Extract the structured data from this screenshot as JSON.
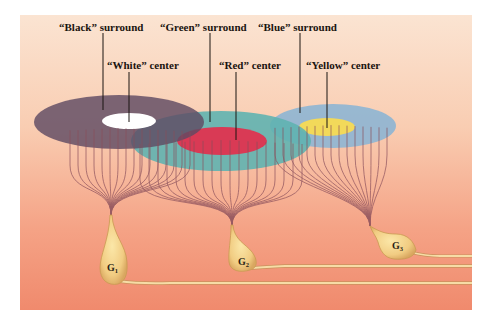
{
  "figure": {
    "panel": {
      "x": 20,
      "y": 15,
      "width": 452,
      "height": 295
    },
    "background_gradient": [
      "#fbe2cf",
      "#f8c4a6",
      "#f4977a",
      "#f18a6e"
    ],
    "labels": {
      "black_surround": "“Black” surround",
      "green_surround": "“Green” surround",
      "blue_surround": "“Blue” surround",
      "white_center": "“White” center",
      "red_center": "“Red” center",
      "yellow_center": "“Yellow” center"
    },
    "receptive_fields": [
      {
        "name": "black-white",
        "surround_color": "#6e5a6e",
        "center_color": "#ffffff"
      },
      {
        "name": "green-red",
        "surround_color": "#5fb3b0",
        "center_color": "#d93a55"
      },
      {
        "name": "blue-yellow",
        "surround_color": "#8fb5d2",
        "center_color": "#f2d95a"
      }
    ],
    "cells": [
      {
        "id": "G1",
        "letter": "G",
        "subscript": "1"
      },
      {
        "id": "G2",
        "letter": "G",
        "subscript": "2"
      },
      {
        "id": "G3",
        "letter": "G",
        "subscript": "3"
      }
    ],
    "colors": {
      "dendrite": "#8a4f5c",
      "leader_line": "#1a1410",
      "cell_body": "#f2cf86",
      "cell_edge": "#c99a52",
      "axon": "#f3d7a0"
    }
  }
}
